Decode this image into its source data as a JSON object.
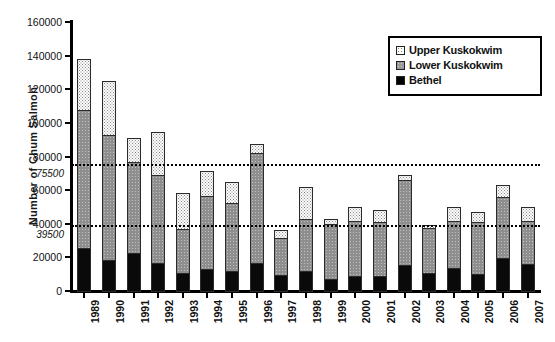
{
  "chart_data": {
    "type": "bar",
    "subtype": "stacked",
    "title": "",
    "xlabel": "",
    "ylabel": "Number of Chum  Salmon",
    "ylim": [
      0,
      160000
    ],
    "ytick_step": 20000,
    "yticks": [
      0,
      20000,
      40000,
      60000,
      80000,
      100000,
      120000,
      140000,
      160000
    ],
    "ytick_labels": [
      "0",
      "20000",
      "40000",
      "60000",
      "80000",
      "100000",
      "120000",
      "140000",
      "160000"
    ],
    "grid": false,
    "legend_position": "top-right",
    "categories": [
      "1989",
      "1990",
      "1991",
      "1992",
      "1993",
      "1994",
      "1995",
      "1996",
      "1997",
      "1998",
      "1999",
      "2000",
      "2001",
      "2002",
      "2003",
      "2004",
      "2005",
      "2006",
      "2007"
    ],
    "series": [
      {
        "name": "Bethel",
        "color": "#0a0a0a",
        "pattern": "solid",
        "values": [
          26000,
          19000,
          23000,
          17000,
          11500,
          13500,
          12500,
          17500,
          10000,
          12500,
          7500,
          9500,
          9500,
          16000,
          11500,
          14500,
          10500,
          20000,
          16500
        ]
      },
      {
        "name": "Lower Kuskokwim",
        "color": "#8e8e8e",
        "pattern": "gray",
        "values": [
          83000,
          75000,
          55000,
          53000,
          26500,
          44000,
          41000,
          66000,
          22500,
          31500,
          33500,
          33500,
          32500,
          51000,
          27000,
          28500,
          31500,
          37000,
          26500
        ]
      },
      {
        "name": "Upper Kuskokwim",
        "color": "#fdfdfd",
        "pattern": "dotted",
        "values": [
          31000,
          32500,
          15000,
          26500,
          22000,
          15500,
          13000,
          6000,
          5500,
          19500,
          3500,
          9000,
          8000,
          4000,
          2500,
          9000,
          7000,
          8000,
          9000
        ]
      }
    ],
    "totals": [
      140000,
      126500,
      93000,
      96500,
      60000,
      73000,
      66500,
      89500,
      38000,
      63500,
      44500,
      52000,
      50000,
      71000,
      41000,
      52000,
      49000,
      65000,
      52000
    ],
    "reference_lines": [
      {
        "value": 75500,
        "label": "75500",
        "style": "dotted"
      },
      {
        "value": 39500,
        "label": "39500",
        "style": "dotted"
      }
    ]
  },
  "legend": {
    "items": [
      {
        "label": "Upper Kuskokwim",
        "swatch": "upper-kuskokwim-swatch"
      },
      {
        "label": "Lower Kuskokwim",
        "swatch": "lower-kuskokwim-swatch"
      },
      {
        "label": "Bethel",
        "swatch": "bethel-swatch"
      }
    ]
  }
}
